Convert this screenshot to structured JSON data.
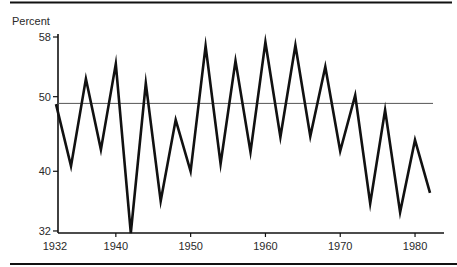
{
  "chart_data": {
    "type": "line",
    "title": "",
    "ylabel": "Percent",
    "xlabel": "",
    "ylim": [
      32,
      58
    ],
    "xlim": [
      1932,
      1983
    ],
    "grid": false,
    "legend": null,
    "yticks": [
      58,
      50,
      40,
      32
    ],
    "xticks": [
      1932,
      1940,
      1950,
      1960,
      1970,
      1980
    ],
    "ytick_labels": [
      "58",
      "50",
      "40",
      "32"
    ],
    "xtick_labels": [
      "1932",
      "1940",
      "1950",
      "1960",
      "1970",
      "1980"
    ],
    "reference_line": {
      "y": 49.1
    },
    "series": [
      {
        "name": "Percent",
        "x": [
          1932,
          1934,
          1936,
          1938,
          1940,
          1942,
          1944,
          1946,
          1948,
          1950,
          1952,
          1954,
          1956,
          1958,
          1960,
          1962,
          1964,
          1966,
          1968,
          1970,
          1972,
          1974,
          1976,
          1978,
          1980,
          1982
        ],
        "values": [
          49.0,
          40.7,
          52.4,
          42.9,
          54.4,
          31.7,
          51.8,
          36.0,
          46.9,
          40.0,
          56.8,
          41.0,
          54.8,
          42.6,
          57.3,
          44.6,
          56.9,
          44.7,
          54.0,
          42.7,
          50.2,
          35.7,
          48.2,
          34.5,
          44.2,
          37.1
        ]
      }
    ]
  }
}
